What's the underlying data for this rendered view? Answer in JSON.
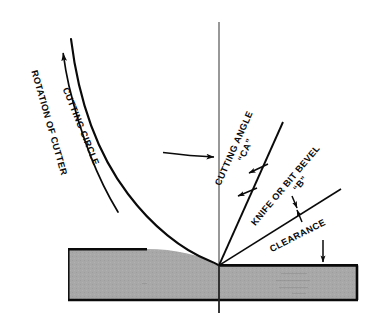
{
  "diagram": {
    "type": "technical-line-drawing",
    "background_color": "#ffffff",
    "line_color": "#0a0a0a",
    "workpiece_fill": "#a8a8a8",
    "workpiece_fill_dark": "#9b9b9b"
  },
  "labels": {
    "rotation_of_cutter": "ROTATION OF CUTTER",
    "cutting_circle": "CUTTING CIRCLE",
    "cutting_angle": "CUTTING ANGLE",
    "cutting_angle_symbol": "“CA”",
    "knife_or_bit_bevel": "KNIFE OR BIT BEVEL",
    "bevel_symbol": "“B”",
    "clearance": "CLEARANCE"
  },
  "geometry": {
    "apex_x": 219,
    "apex_y": 265,
    "centerline_x": 219,
    "centerline_top_y": 22,
    "centerline_bottom_y": 313,
    "workpiece_left_x": 68,
    "workpiece_right_x": 358,
    "workpiece_left_top_y": 249,
    "workpiece_right_top_y": 265,
    "workpiece_bottom_y": 300,
    "cutting_angle_line_top_x": 283,
    "cutting_angle_line_top_y": 122,
    "clearance_line_right_x": 341,
    "clearance_line_right_y": 189,
    "feed_arrow_y": 157,
    "feed_arrow_from_x": 163,
    "feed_arrow_to_x": 216
  }
}
